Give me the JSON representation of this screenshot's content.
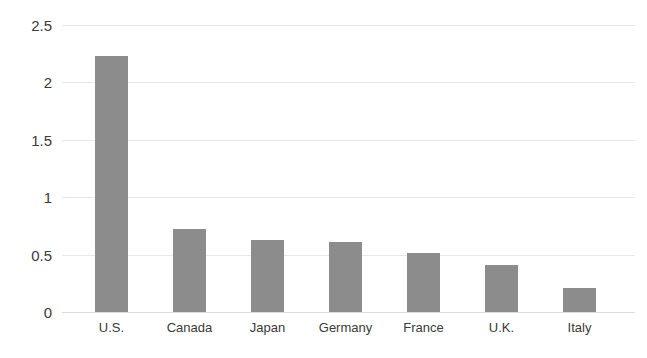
{
  "chart_data": {
    "type": "bar",
    "title": "",
    "subtitle": "",
    "xlabel": "",
    "ylabel": "",
    "categories": [
      "U.S.",
      "Canada",
      "Japan",
      "Germany",
      "France",
      "U.K.",
      "Italy"
    ],
    "values": [
      2.23,
      0.72,
      0.63,
      0.61,
      0.51,
      0.41,
      0.21
    ],
    "series": [
      {
        "name": "",
        "values": [
          2.23,
          0.72,
          0.63,
          0.61,
          0.51,
          0.41,
          0.21
        ]
      }
    ],
    "ylim": [
      0,
      2.5
    ],
    "yticks": [
      0,
      0.5,
      1,
      1.5,
      2,
      2.5
    ],
    "ytick_labels": [
      "0",
      "0.5",
      "1",
      "1.5",
      "2",
      "2.5"
    ],
    "grid": "horizontal",
    "legend": "none",
    "orientation": "vertical",
    "bar_color": "#8c8c8c",
    "gridline_color": "#e8e8e8",
    "axis_color": "#dcdcdc",
    "text_color": "#3a3a3a"
  }
}
